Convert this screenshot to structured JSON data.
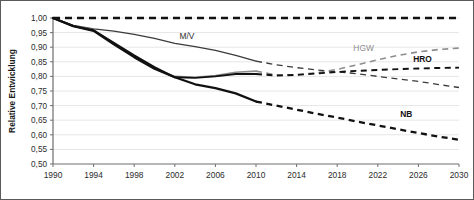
{
  "chart_data": {
    "type": "line",
    "title": "",
    "xlabel": "",
    "ylabel": "Relative Entwicklung",
    "xlim": [
      1990,
      2030
    ],
    "ylim": [
      0.5,
      1.0
    ],
    "grid": true,
    "legend_position": "inline-annotations",
    "x_ticks": [
      1990,
      1994,
      1998,
      2002,
      2006,
      2010,
      2014,
      2018,
      2022,
      2026,
      2030
    ],
    "y_ticks": [
      "0,50",
      "0,55",
      "0,60",
      "0,65",
      "0,70",
      "0,75",
      "0,80",
      "0,85",
      "0,90",
      "0,95",
      "1,00"
    ],
    "y_tick_values": [
      0.5,
      0.55,
      0.6,
      0.65,
      0.7,
      0.75,
      0.8,
      0.85,
      0.9,
      0.95,
      1.0
    ],
    "decimal_separator": ",",
    "history_end_year": 2010,
    "series": [
      {
        "name": "Referenz",
        "label": "",
        "color": "#111111",
        "style": "dashed",
        "width": 2.6,
        "x": [
          1990,
          2030
        ],
        "values": [
          1.0,
          1.0
        ]
      },
      {
        "name": "M/V",
        "label": "M/V",
        "color": "#3b3b3b",
        "style": "solid-then-dashed",
        "width": 1.3,
        "x": [
          1990,
          1992,
          1994,
          1996,
          1998,
          2000,
          2002,
          2004,
          2006,
          2008,
          2010,
          2012,
          2014,
          2016,
          2018,
          2020,
          2022,
          2024,
          2026,
          2028,
          2030
        ],
        "values": [
          1.0,
          0.975,
          0.963,
          0.955,
          0.944,
          0.93,
          0.913,
          0.902,
          0.889,
          0.872,
          0.852,
          0.84,
          0.83,
          0.822,
          0.816,
          0.809,
          0.8,
          0.791,
          0.783,
          0.772,
          0.762
        ]
      },
      {
        "name": "HGW",
        "label": "HGW",
        "color": "#8d8d8d",
        "style": "solid-then-dashed",
        "width": 1.6,
        "x": [
          1990,
          1992,
          1994,
          1996,
          1998,
          2000,
          2002,
          2004,
          2006,
          2008,
          2010,
          2012,
          2014,
          2016,
          2018,
          2020,
          2022,
          2024,
          2026,
          2028,
          2030
        ],
        "values": [
          1.0,
          0.973,
          0.96,
          0.91,
          0.868,
          0.828,
          0.8,
          0.797,
          0.803,
          0.814,
          0.818,
          0.805,
          0.806,
          0.812,
          0.824,
          0.84,
          0.857,
          0.872,
          0.884,
          0.892,
          0.897
        ]
      },
      {
        "name": "HRO",
        "label": "HRO",
        "color": "#111111",
        "style": "solid-then-dashed",
        "width": 1.9,
        "x": [
          1990,
          1992,
          1994,
          1996,
          1998,
          2000,
          2002,
          2004,
          2006,
          2008,
          2010,
          2012,
          2014,
          2016,
          2018,
          2020,
          2022,
          2024,
          2026,
          2028,
          2030
        ],
        "values": [
          1.0,
          0.972,
          0.958,
          0.915,
          0.872,
          0.832,
          0.797,
          0.795,
          0.8,
          0.808,
          0.808,
          0.803,
          0.805,
          0.81,
          0.815,
          0.819,
          0.822,
          0.825,
          0.827,
          0.829,
          0.83
        ]
      },
      {
        "name": "NB",
        "label": "NB",
        "color": "#111111",
        "style": "solid-then-dashed",
        "width": 2.3,
        "x": [
          1990,
          1992,
          1994,
          1996,
          1998,
          2000,
          2002,
          2004,
          2006,
          2008,
          2010,
          2012,
          2014,
          2016,
          2018,
          2020,
          2022,
          2024,
          2026,
          2028,
          2030
        ],
        "values": [
          1.0,
          0.972,
          0.956,
          0.91,
          0.866,
          0.826,
          0.797,
          0.773,
          0.76,
          0.742,
          0.714,
          0.7,
          0.686,
          0.672,
          0.659,
          0.645,
          0.632,
          0.619,
          0.606,
          0.594,
          0.583
        ]
      }
    ],
    "annotations": [
      {
        "text": "M/V",
        "x": 2003.2,
        "y": 0.928,
        "bold": false,
        "gray": false
      },
      {
        "text": "HGW",
        "x": 2020.6,
        "y": 0.887,
        "bold": false,
        "gray": true
      },
      {
        "text": "HRO",
        "x": 2026.4,
        "y": 0.85,
        "bold": true,
        "gray": false
      },
      {
        "text": "NB",
        "x": 2024.8,
        "y": 0.661,
        "bold": true,
        "gray": false
      }
    ]
  }
}
